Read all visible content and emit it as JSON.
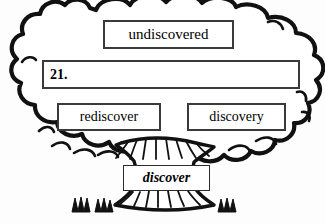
{
  "exercise": {
    "number_label": "21.",
    "root_word": "discover",
    "answer_value": "",
    "answer_placeholder": ""
  },
  "word_family_tree": {
    "canopy_words": [
      {
        "id": "undiscovered",
        "text": "undiscovered"
      },
      {
        "id": "rediscover",
        "text": "rediscover"
      },
      {
        "id": "discovery",
        "text": "discovery"
      }
    ],
    "trunk_word": {
      "id": "discover",
      "text": "discover"
    },
    "blank_box": {
      "id": "answer-21",
      "label": "21.",
      "value": ""
    }
  },
  "graphics": {
    "canopy_icon": "tree-canopy-cloud",
    "trunk_icon": "tree-trunk",
    "grass_icon": "grass-tuft",
    "grass_tuft_count": 3
  },
  "colors": {
    "ink": "#000000",
    "outline": "#1a1a1a",
    "box_border": "#3a3a3a",
    "paper": "#fdfdfd",
    "fill": "#ffffff"
  }
}
